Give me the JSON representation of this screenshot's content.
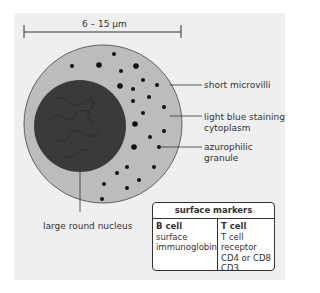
{
  "scale": {
    "label": "6 – 15 µm"
  },
  "labels": {
    "microvilli": "short microvilli",
    "cytoplasm_1": "light blue staining",
    "cytoplasm_2": "cytoplasm",
    "granule_1": "azurophilic",
    "granule_2": "granule",
    "nucleus": "large round nucleus"
  },
  "table": {
    "title": "surface markers",
    "b_cell": {
      "heading": "B cell",
      "lines": [
        "surface",
        "immunoglobin"
      ]
    },
    "t_cell": {
      "heading": "T cell",
      "lines": [
        "T cell receptor",
        "CD4 or CD8",
        "CD3"
      ]
    }
  },
  "colors": {
    "panel": "#efefef",
    "cytoplasm": "#bcbcbc",
    "nucleus": "#3a3a3a",
    "granule": "#111111"
  }
}
